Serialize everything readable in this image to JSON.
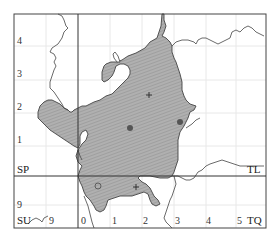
{
  "map": {
    "grid_squares": {
      "top_left": "SP",
      "top_right": "TL",
      "bottom_left": "SU",
      "bottom_right": "TQ"
    },
    "y_axis_labels": [
      "4",
      "3",
      "2",
      "1",
      "9"
    ],
    "x_axis_labels": [
      "9",
      "0",
      "1",
      "2",
      "3",
      "4",
      "5"
    ],
    "colors": {
      "shaded_region": "#a9a9a9",
      "outline": "#444444",
      "grid_major": "#333333",
      "grid_minor": "#e6e6e6",
      "marker": "#555555"
    },
    "markers": [
      {
        "type": "cross",
        "name": "record-cross-north"
      },
      {
        "type": "filled-circle",
        "name": "record-dot-west"
      },
      {
        "type": "filled-circle",
        "name": "record-dot-east"
      },
      {
        "type": "open-circle",
        "name": "record-open-circle"
      },
      {
        "type": "cross",
        "name": "record-cross-south"
      }
    ]
  }
}
